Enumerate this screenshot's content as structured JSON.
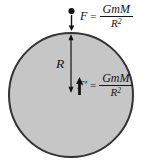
{
  "diagram": {
    "colors": {
      "sphere_fill": "#c6c6c6",
      "sphere_stroke": "#333333",
      "ink": "#141414"
    },
    "labels": {
      "radius": "R"
    },
    "equations": {
      "external": {
        "lhs": "F",
        "equals": "=",
        "numerator": "GmM",
        "denominator_base": "R",
        "denominator_exponent": "2"
      },
      "internal": {
        "lhs": "F′",
        "equals": "=",
        "numerator": "GmM",
        "denominator_base": "R",
        "denominator_exponent": "2"
      }
    }
  }
}
